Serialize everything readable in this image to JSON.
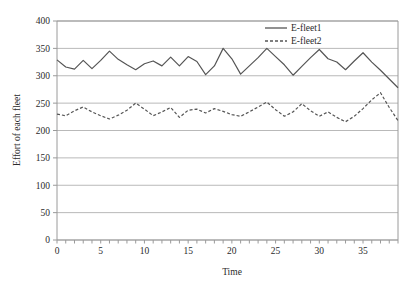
{
  "chart_data": {
    "type": "line",
    "title": "",
    "xlabel": "Time",
    "ylabel": "Effort of each fleet",
    "xlim": [
      0,
      39
    ],
    "ylim": [
      0,
      400
    ],
    "ytick_step": 50,
    "xtick_step": 5,
    "xticks": [
      "0",
      "5",
      "10",
      "15",
      "20",
      "25",
      "30",
      "35"
    ],
    "xtick_values": [
      0,
      5,
      10,
      15,
      20,
      25,
      30,
      35
    ],
    "yticks": [
      "0",
      "50",
      "100",
      "150",
      "200",
      "250",
      "300",
      "350",
      "400"
    ],
    "ytick_values": [
      0,
      50,
      100,
      150,
      200,
      250,
      300,
      350,
      400
    ],
    "grid": "horizontal",
    "legend_position": "top-right-inside",
    "x": [
      0,
      1,
      2,
      3,
      4,
      5,
      6,
      7,
      8,
      9,
      10,
      11,
      12,
      13,
      14,
      15,
      16,
      17,
      18,
      19,
      20,
      21,
      22,
      23,
      24,
      25,
      26,
      27,
      28,
      29,
      30,
      31,
      32,
      33,
      34,
      35,
      36,
      37,
      38,
      39
    ],
    "series": [
      {
        "name": "E-fleet1",
        "style": "solid",
        "color": "#555555",
        "values": [
          329,
          316,
          312,
          328,
          313,
          328,
          345,
          330,
          320,
          311,
          322,
          327,
          318,
          334,
          318,
          335,
          326,
          302,
          318,
          350,
          331,
          303,
          318,
          333,
          350,
          335,
          320,
          301,
          317,
          333,
          348,
          331,
          325,
          311,
          327,
          342,
          325,
          310,
          294,
          278
        ]
      },
      {
        "name": "E-fleet2",
        "style": "dashed",
        "color": "#555555",
        "values": [
          230,
          227,
          236,
          243,
          234,
          227,
          221,
          228,
          237,
          250,
          239,
          227,
          234,
          242,
          224,
          237,
          239,
          232,
          240,
          235,
          229,
          226,
          234,
          243,
          252,
          238,
          226,
          234,
          249,
          236,
          226,
          234,
          224,
          216,
          226,
          240,
          256,
          269,
          242,
          218
        ]
      }
    ]
  },
  "axes": {
    "y_title": "Effort of each fleet",
    "x_title": "Time"
  },
  "legend": {
    "items": [
      {
        "label": "E-fleet1",
        "style": "solid"
      },
      {
        "label": "E-fleet2",
        "style": "dashed"
      }
    ]
  },
  "colors": {
    "series": "#555555",
    "grid": "#b9b9b9",
    "frame": "#9a9a9a",
    "text": "#2b2b2b",
    "background": "#ffffff"
  }
}
